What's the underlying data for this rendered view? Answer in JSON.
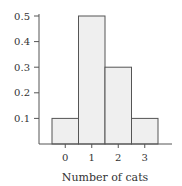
{
  "chart_data": {
    "type": "bar",
    "title": "",
    "xlabel": "Number of cats",
    "ylabel": "",
    "categories": [
      "0",
      "1",
      "2",
      "3"
    ],
    "values": [
      0.1,
      0.5,
      0.3,
      0.1
    ],
    "ylim": [
      0,
      0.5
    ],
    "yticks": [
      "0.1",
      "0.2",
      "0.3",
      "0.4",
      "0.5"
    ],
    "ytick_values": [
      0.1,
      0.2,
      0.3,
      0.4,
      0.5
    ],
    "grid": false,
    "legend": null,
    "bar_style": "histogram (adjacent bars, no gaps)",
    "colors": {
      "bar_fill": "#efefef",
      "bar_stroke": "#555555",
      "axis": "#555555",
      "text": "#333333"
    }
  }
}
